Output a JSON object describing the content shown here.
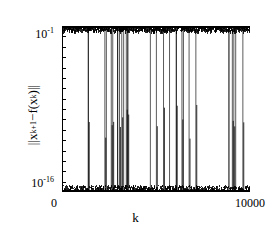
{
  "chart_data": {
    "type": "line",
    "title": "",
    "xlabel": "k",
    "ylabel": "||x_{k+1} - f(x_k)||",
    "ylabel_parts": {
      "bar_open": "||",
      "x": "x",
      "x_sub": "k+1",
      "minus": " − ",
      "f": "f(",
      "fx": "x",
      "fx_sub": "k",
      "fclose": ")",
      "bar_close": "||"
    },
    "xscale": "linear",
    "yscale": "log",
    "xlim": [
      0,
      10000
    ],
    "ylim": [
      1e-16,
      0.1
    ],
    "xticks": [
      0,
      10000
    ],
    "xtick_labels": [
      "0",
      "10000"
    ],
    "yticks": [
      0.1,
      1e-16
    ],
    "ytick_labels": [
      "10^-1",
      "10^-16"
    ],
    "ytick_label_top_mantissa": "10",
    "ytick_label_top_exponent": "-1",
    "ytick_label_bottom_mantissa": "10",
    "ytick_label_bottom_exponent": "-16",
    "yminor_tick_count": 16,
    "grid": false,
    "legend": null,
    "series_color": "#000000",
    "upper_band": {
      "center": 0.09,
      "half_width_decades": 0.35,
      "label": "upper noise band near 1e-1",
      "coverage": "full x range"
    },
    "lower_band": {
      "center": 1.3e-16,
      "half_width_decades": 0.5,
      "label": "lower noise band near 1e-16",
      "coverage": "full x range"
    },
    "spikes_k": [
      1400,
      2280,
      2360,
      2620,
      2700,
      2960,
      3060,
      3180,
      3280,
      3420,
      3500,
      4700,
      5020,
      5400,
      5720,
      6080,
      6380,
      6460,
      6760,
      7120,
      8880,
      9060,
      9140,
      9240,
      9620
    ],
    "spike_count": 25,
    "noise_point_count": 10000
  }
}
